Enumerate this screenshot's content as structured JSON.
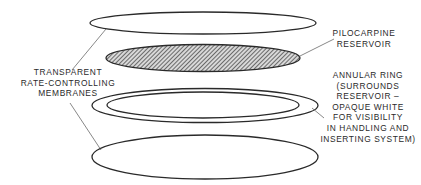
{
  "diagram": {
    "type": "exploded-layer-diagram",
    "layers": [
      {
        "id": "top-membrane",
        "kind": "transparent-membrane",
        "fill": "none"
      },
      {
        "id": "pilocarpine-reservoir",
        "kind": "drug-reservoir",
        "fill": "hatched"
      },
      {
        "id": "annular-ring",
        "kind": "ring",
        "fill": "none"
      },
      {
        "id": "bottom-membrane",
        "kind": "transparent-membrane",
        "fill": "none"
      }
    ],
    "colors": {
      "stroke": "#2a2a2a",
      "hatch": "#3a3a3a",
      "background": "#ffffff"
    }
  },
  "labels": {
    "membranes": {
      "lines": [
        "TRANSPARENT",
        "RATE-CONTROLLING",
        "MEMBRANES"
      ]
    },
    "reservoir": {
      "lines": [
        "PILOCARPINE",
        "RESERVOIR"
      ]
    },
    "ring": {
      "lines": [
        "ANNULAR RING",
        "(SURROUNDS",
        "RESERVOIR –",
        "OPAQUE WHITE",
        "FOR VISIBILITY",
        "IN HANDLING AND",
        "INSERTING SYSTEM)"
      ]
    }
  }
}
